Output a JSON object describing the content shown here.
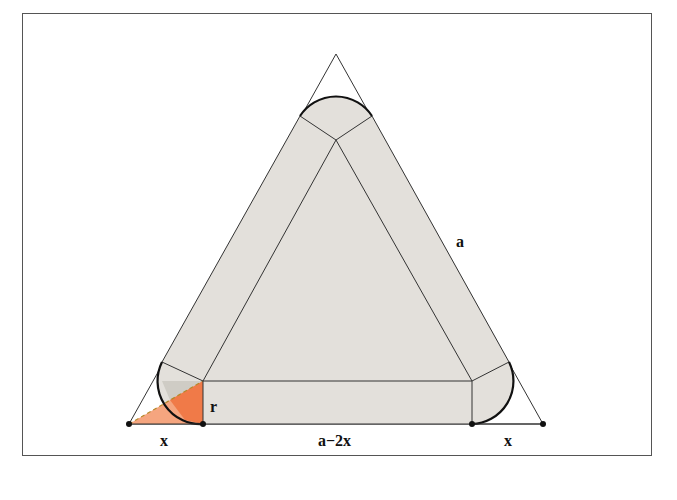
{
  "figure": {
    "labels": {
      "side": "a",
      "radius": "r",
      "left_segment": "x",
      "middle_segment": "a−2x",
      "right_segment": "x"
    },
    "colors": {
      "fill": "#e3e0db",
      "stroke": "#222222",
      "highlight_triangle": "#f07a48",
      "highlight_light": "#f5a57f",
      "frame": "#555555"
    },
    "points": {
      "outer_apex": [
        336,
        54
      ],
      "outer_bottom_left": [
        129,
        424
      ],
      "outer_bottom_right": [
        543,
        424
      ],
      "inner_top": [
        336,
        140
      ],
      "inner_bottom_left": [
        203,
        381
      ],
      "inner_bottom_right": [
        472,
        381
      ],
      "base_dots": [
        [
          129,
          424
        ],
        [
          203,
          424
        ],
        [
          472,
          424
        ],
        [
          543,
          424
        ]
      ]
    }
  }
}
